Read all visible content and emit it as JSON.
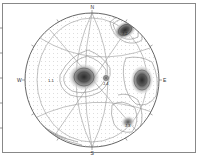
{
  "figure": {
    "type": "stereonet-pole-density-contour",
    "projection": "equal-area lower hemisphere",
    "directions": {
      "north": "N",
      "south": "S",
      "west": "W",
      "east": "E"
    }
  },
  "clusters": [
    {
      "label": "J-2",
      "cx": 125,
      "cy": 30,
      "rx": 12,
      "ry": 8,
      "rot": -30,
      "density": "high"
    },
    {
      "label": "",
      "cx": 84,
      "cy": 77,
      "rx": 15,
      "ry": 13,
      "rot": 0,
      "density": "very-high"
    },
    {
      "label": "J-4",
      "cx": 106,
      "cy": 78,
      "rx": 4,
      "ry": 4,
      "rot": 0,
      "density": "medium"
    },
    {
      "label": "",
      "cx": 142,
      "cy": 80,
      "rx": 11,
      "ry": 14,
      "rot": 0,
      "density": "very-high"
    },
    {
      "label": "J-3",
      "cx": 128,
      "cy": 122,
      "rx": 7,
      "ry": 6,
      "rot": -20,
      "density": "medium"
    },
    {
      "label": "1-1",
      "cx": 50,
      "cy": 80,
      "rx": 0,
      "ry": 0,
      "rot": 0,
      "density": "label-only"
    }
  ],
  "colors": {
    "frame": "#888888",
    "circle": "#777777",
    "contour": "#8a8a8a",
    "dense_fill": "#3a3a3a",
    "background": "#ffffff"
  }
}
